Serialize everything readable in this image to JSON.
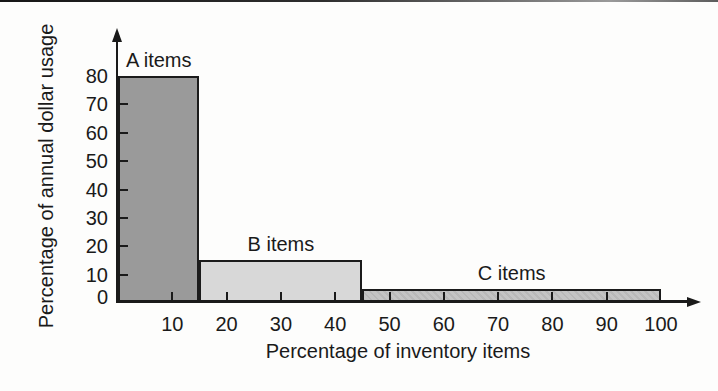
{
  "chart_data": {
    "type": "bar",
    "xlabel": "Percentage of inventory items",
    "ylabel": "Percentage of annual dollar usage",
    "xlim": [
      0,
      100
    ],
    "ylim": [
      0,
      80
    ],
    "x_ticks": [
      10,
      20,
      30,
      40,
      50,
      60,
      70,
      80,
      90,
      100
    ],
    "y_ticks": [
      0,
      10,
      20,
      30,
      40,
      50,
      60,
      70,
      80
    ],
    "grid": false,
    "legend": "none",
    "axis_color": "#1a1a1a",
    "text_color": "#1a1a1a",
    "bar_border_color": "#1b1b1b",
    "segments": [
      {
        "label": "A items",
        "x_start": 0,
        "x_end": 15,
        "inventory_pct": 15,
        "value": 80,
        "color": "#9a9a9a",
        "texture": "dots"
      },
      {
        "label": "B items",
        "x_start": 15,
        "x_end": 45,
        "inventory_pct": 30,
        "value": 15,
        "color": "#d8d8d8",
        "texture": "plain"
      },
      {
        "label": "C items",
        "x_start": 45,
        "x_end": 100,
        "inventory_pct": 55,
        "value": 5,
        "color": "#c4c4c4",
        "texture": "hatch"
      }
    ]
  }
}
